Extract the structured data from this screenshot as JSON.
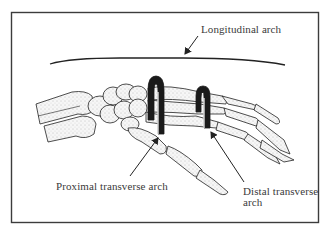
{
  "figure": {
    "colors": {
      "background": "#ffffff",
      "frame": "#3c3c3c",
      "ink": "#222222",
      "bone_fill": "#f4f4f4",
      "stipple": "#8a8a8a",
      "label_text": "#3a3a3a"
    },
    "labels": {
      "longitudinal": "Longitudinal arch",
      "proximal": "Proximal transverse arch",
      "distal_line1": "Distal transverse",
      "distal_line2": "arch"
    },
    "annotations": [
      {
        "id": "longitudinal-arch",
        "text": "Longitudinal arch",
        "target": "curved arc above the hand skeleton"
      },
      {
        "id": "proximal-transverse-arch",
        "text": "Proximal transverse arch",
        "target": "hook at carpal bones"
      },
      {
        "id": "distal-transverse-arch",
        "text": "Distal transverse arch",
        "target": "hook at metacarpal heads"
      }
    ]
  }
}
